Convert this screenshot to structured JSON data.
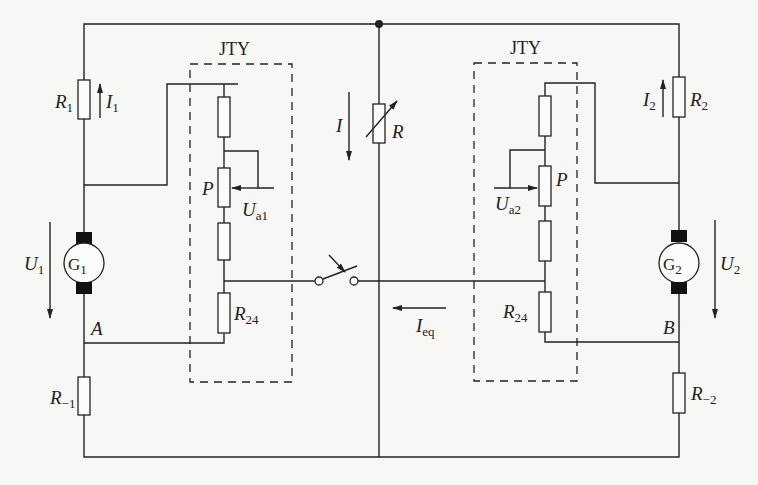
{
  "diagram": {
    "type": "circuit-schematic",
    "blocks": {
      "left_regulator": {
        "label": "JTY"
      },
      "right_regulator": {
        "label": "JTY"
      }
    },
    "components": {
      "R1": {
        "main": "R",
        "sub": "1"
      },
      "I1": {
        "main": "I",
        "sub": "1"
      },
      "R2": {
        "main": "R",
        "sub": "2"
      },
      "I2": {
        "main": "I",
        "sub": "2"
      },
      "I": {
        "main": "I"
      },
      "R": {
        "main": "R"
      },
      "G1": {
        "main": "G",
        "sub": "1"
      },
      "G2": {
        "main": "G",
        "sub": "2"
      },
      "U1": {
        "main": "U",
        "sub": "1"
      },
      "U2": {
        "main": "U",
        "sub": "2"
      },
      "P_left": {
        "main": "P"
      },
      "P_right": {
        "main": "P"
      },
      "Ua1": {
        "main": "U",
        "sub": "a1"
      },
      "Ua2": {
        "main": "U",
        "sub": "a2"
      },
      "R24_left": {
        "main": "R",
        "sub": "24"
      },
      "R24_right": {
        "main": "R",
        "sub": "24"
      },
      "Ieq": {
        "main": "I",
        "sub": "eq"
      },
      "A": {
        "main": "A"
      },
      "B": {
        "main": "B"
      },
      "R_1": {
        "main": "R",
        "sub": "−1"
      },
      "R_2": {
        "main": "R",
        "sub": "−2"
      }
    },
    "colors": {
      "line": "#222222",
      "background": "#f7f7f5"
    }
  }
}
